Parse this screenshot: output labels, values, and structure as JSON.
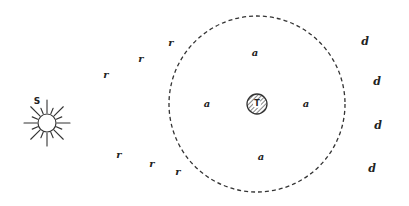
{
  "diagram": {
    "colors": {
      "ink": "#222222",
      "background": "#ffffff"
    },
    "sun": {
      "label": "S",
      "icon": "sun-icon",
      "cx": 47,
      "cy": 123,
      "r": 9,
      "label_pos": {
        "x": 37,
        "y": 101
      }
    },
    "earth": {
      "label": "T",
      "icon": "hatched-circle-icon",
      "cx": 257,
      "cy": 104,
      "r": 10
    },
    "orbit": {
      "style": "dashed",
      "cx": 257,
      "cy": 104,
      "r": 88
    },
    "labels_a": [
      {
        "text": "a",
        "x": 255,
        "y": 53
      },
      {
        "text": "a",
        "x": 207,
        "y": 104
      },
      {
        "text": "a",
        "x": 306,
        "y": 104
      },
      {
        "text": "a",
        "x": 261,
        "y": 157
      }
    ],
    "labels_r": [
      {
        "text": "r",
        "x": 106,
        "y": 75
      },
      {
        "text": "r",
        "x": 141,
        "y": 59
      },
      {
        "text": "r",
        "x": 171,
        "y": 43
      },
      {
        "text": "r",
        "x": 119,
        "y": 155
      },
      {
        "text": "r",
        "x": 152,
        "y": 164
      },
      {
        "text": "r",
        "x": 178,
        "y": 172
      }
    ],
    "labels_d": [
      {
        "text": "d",
        "x": 365,
        "y": 41
      },
      {
        "text": "d",
        "x": 377,
        "y": 81
      },
      {
        "text": "d",
        "x": 378,
        "y": 125
      },
      {
        "text": "d",
        "x": 372,
        "y": 168
      }
    ]
  }
}
